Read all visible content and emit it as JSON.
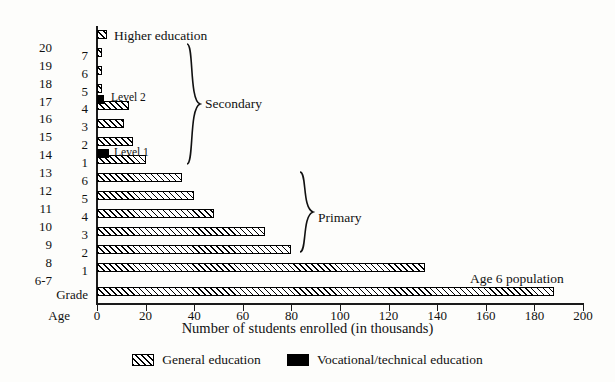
{
  "chart_data": {
    "type": "bar",
    "orientation": "horizontal",
    "title": "",
    "xlabel": "Number of students enrolled (in thousands)",
    "ylabel": "Age",
    "xlim": [
      0,
      200
    ],
    "xticks": [
      0,
      20,
      40,
      60,
      80,
      100,
      120,
      140,
      160,
      180,
      200
    ],
    "grid": false,
    "legend_position": "bottom",
    "series": [
      {
        "name": "General education",
        "color": "#ffffff",
        "pattern": "diagonal-hatch"
      },
      {
        "name": "Vocational/technical education",
        "color": "#000000",
        "pattern": "solid"
      }
    ],
    "rows": [
      {
        "age": "",
        "grade": "",
        "level": "Higher education",
        "general": 4,
        "vocational": 0
      },
      {
        "age": "20",
        "grade": "7",
        "level": "Secondary",
        "general": 2,
        "vocational": 0
      },
      {
        "age": "19",
        "grade": "6",
        "level": "Secondary",
        "general": 2,
        "vocational": 0
      },
      {
        "age": "18",
        "grade": "5",
        "level": "Secondary",
        "general": 2,
        "vocational": 0
      },
      {
        "age": "17",
        "grade": "4",
        "level": "Secondary",
        "general": 13,
        "vocational": 3
      },
      {
        "age": "16",
        "grade": "3",
        "level": "Secondary",
        "general": 11,
        "vocational": 0
      },
      {
        "age": "15",
        "grade": "2",
        "level": "Secondary",
        "general": 15,
        "vocational": 0
      },
      {
        "age": "14",
        "grade": "1",
        "level": "Secondary",
        "general": 20,
        "vocational": 5
      },
      {
        "age": "13",
        "grade": "6",
        "level": "Primary",
        "general": 35,
        "vocational": 0
      },
      {
        "age": "12",
        "grade": "5",
        "level": "Primary",
        "general": 40,
        "vocational": 0
      },
      {
        "age": "11",
        "grade": "4",
        "level": "Primary",
        "general": 48,
        "vocational": 0
      },
      {
        "age": "10",
        "grade": "3",
        "level": "Primary",
        "general": 69,
        "vocational": 0
      },
      {
        "age": "9",
        "grade": "2",
        "level": "Primary",
        "general": 80,
        "vocational": 0
      },
      {
        "age": "8",
        "grade": "1",
        "level": "Primary",
        "general": 135,
        "vocational": 0
      },
      {
        "age": "6-7",
        "grade": "Grade",
        "level": "Age 6 population",
        "general": 188,
        "vocational": 0
      }
    ],
    "age_axis_labels": [
      "20",
      "19",
      "18",
      "17",
      "16",
      "15",
      "14",
      "13",
      "12",
      "11",
      "10",
      "9",
      "8",
      "6-7"
    ],
    "grade_axis_labels": [
      "7",
      "6",
      "5",
      "4",
      "3",
      "2",
      "1",
      "6",
      "5",
      "4",
      "3",
      "2",
      "1",
      "Grade"
    ],
    "annotations": [
      {
        "text": "Higher education",
        "name": "higher-education-label"
      },
      {
        "text": "Level 2",
        "name": "level-2-label"
      },
      {
        "text": "Level 1",
        "name": "level-1-label"
      },
      {
        "text": "Secondary",
        "name": "secondary-bracket-label"
      },
      {
        "text": "Primary",
        "name": "primary-bracket-label"
      },
      {
        "text": "Age 6 population",
        "name": "age-6-population-label"
      }
    ]
  },
  "axis": {
    "age_corner_label": "Age",
    "grade_corner_label": "Grade",
    "x_title": "Number of students enrolled (in thousands)",
    "ticks": [
      "0",
      "20",
      "40",
      "60",
      "80",
      "100",
      "120",
      "140",
      "160",
      "180",
      "200"
    ]
  },
  "legend": {
    "general_label": "General education",
    "vocational_label": "Vocational/technical education"
  },
  "annotations": {
    "higher_education": "Higher education",
    "level_2": "Level 2",
    "level_1": "Level 1",
    "secondary": "Secondary",
    "primary": "Primary",
    "age_6_population": "Age 6 population"
  }
}
